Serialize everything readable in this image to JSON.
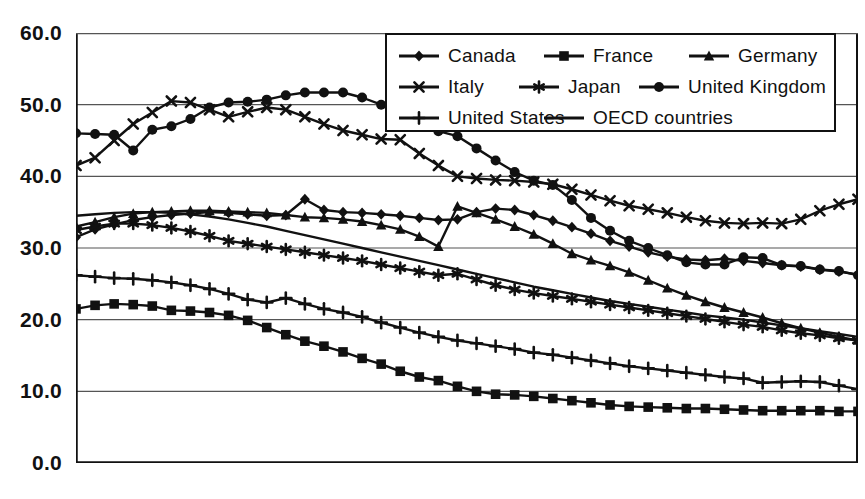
{
  "chart_data": {
    "type": "line",
    "title": "",
    "subtitle": "",
    "xlabel": "",
    "ylabel": "",
    "ylim": [
      0.0,
      60.0
    ],
    "yticks": [
      "0.0",
      "10.0",
      "20.0",
      "30.0",
      "40.0",
      "50.0",
      "60.0"
    ],
    "ytick_values": [
      0.0,
      10.0,
      20.0,
      30.0,
      40.0,
      50.0,
      60.0
    ],
    "grid": true,
    "grid_axis": "y",
    "legend_position": "top-right",
    "xtick_count": 42,
    "xtick_labels": [],
    "x": [
      1,
      2,
      3,
      4,
      5,
      6,
      7,
      8,
      9,
      10,
      11,
      12,
      13,
      14,
      15,
      16,
      17,
      18,
      19,
      20,
      21,
      22,
      23,
      24,
      25,
      26,
      27,
      28,
      29,
      30,
      31,
      32,
      33,
      34,
      35,
      36,
      37,
      38,
      39,
      40,
      41,
      42
    ],
    "series": [
      {
        "name": "Canada",
        "marker": "diamond",
        "values": [
          31.5,
          32.6,
          33.3,
          33.9,
          34.3,
          34.6,
          34.8,
          35.0,
          34.9,
          34.7,
          34.5,
          34.6,
          36.8,
          35.3,
          35.0,
          34.9,
          34.7,
          34.5,
          34.2,
          33.9,
          34.0,
          35.0,
          35.5,
          35.3,
          34.6,
          33.8,
          32.9,
          32.0,
          31.0,
          30.2,
          29.4,
          28.8,
          28.4,
          28.3,
          28.5,
          28.2,
          27.9,
          27.6,
          27.4,
          27.0,
          26.7,
          26.3
        ]
      },
      {
        "name": "France",
        "marker": "square",
        "values": [
          21.5,
          22.0,
          22.2,
          22.1,
          21.9,
          21.3,
          21.2,
          21.0,
          20.6,
          19.9,
          18.9,
          17.9,
          17.0,
          16.3,
          15.5,
          14.6,
          13.8,
          12.8,
          12.0,
          11.5,
          10.7,
          10.0,
          9.6,
          9.5,
          9.3,
          9.0,
          8.7,
          8.4,
          8.1,
          7.9,
          7.8,
          7.7,
          7.6,
          7.6,
          7.5,
          7.4,
          7.3,
          7.3,
          7.3,
          7.3,
          7.2,
          7.2
        ]
      },
      {
        "name": "Germany",
        "marker": "triangle",
        "values": [
          33.0,
          33.6,
          34.3,
          34.8,
          35.0,
          35.1,
          35.2,
          35.2,
          35.1,
          35.0,
          34.9,
          34.6,
          34.3,
          34.2,
          34.0,
          33.7,
          33.2,
          32.6,
          31.6,
          30.2,
          35.8,
          34.9,
          34.0,
          33.0,
          31.9,
          30.6,
          29.2,
          28.3,
          27.5,
          26.6,
          25.5,
          24.4,
          23.4,
          22.5,
          21.7,
          21.0,
          20.3,
          19.5,
          18.8,
          18.2,
          17.6,
          17.1
        ]
      },
      {
        "name": "Italy",
        "marker": "x",
        "values": [
          41.5,
          42.6,
          45.0,
          47.3,
          48.9,
          50.5,
          50.3,
          49.3,
          48.3,
          49.0,
          49.6,
          49.3,
          48.3,
          47.3,
          46.4,
          45.8,
          45.2,
          45.1,
          43.2,
          41.5,
          40.0,
          39.7,
          39.5,
          39.4,
          39.2,
          38.9,
          38.2,
          37.4,
          36.6,
          35.9,
          35.4,
          34.9,
          34.3,
          33.8,
          33.5,
          33.4,
          33.5,
          33.4,
          34.0,
          35.2,
          36.1,
          36.8
        ]
      },
      {
        "name": "Japan",
        "marker": "asterisk",
        "values": [
          32.5,
          33.0,
          33.4,
          33.4,
          33.2,
          32.8,
          32.3,
          31.7,
          31.0,
          30.6,
          30.2,
          29.8,
          29.4,
          29.0,
          28.6,
          28.2,
          27.7,
          27.2,
          26.7,
          26.2,
          26.4,
          25.6,
          24.8,
          24.2,
          23.7,
          23.3,
          22.9,
          22.5,
          22.1,
          21.7,
          21.3,
          20.9,
          20.5,
          20.1,
          19.7,
          19.3,
          19.0,
          18.5,
          18.1,
          17.8,
          17.4,
          17.1
        ]
      },
      {
        "name": "United Kingdom",
        "marker": "circle",
        "values": [
          46.0,
          45.9,
          45.8,
          43.6,
          46.5,
          47.0,
          48.0,
          49.6,
          50.3,
          50.4,
          50.7,
          51.3,
          51.7,
          51.7,
          51.7,
          51.0,
          50.0,
          48.8,
          48.3,
          46.3,
          45.6,
          43.9,
          42.2,
          40.6,
          39.4,
          38.8,
          36.7,
          34.2,
          32.4,
          31.0,
          30.0,
          29.0,
          28.0,
          27.7,
          27.7,
          28.7,
          28.6,
          27.6,
          27.5,
          27.0,
          26.8,
          26.2
        ]
      },
      {
        "name": "United States",
        "marker": "plus",
        "values": [
          26.2,
          26.0,
          25.8,
          25.7,
          25.5,
          25.2,
          24.8,
          24.3,
          23.6,
          22.8,
          22.4,
          23.0,
          22.2,
          21.5,
          21.0,
          20.4,
          19.6,
          18.9,
          18.2,
          17.6,
          17.1,
          16.7,
          16.3,
          15.9,
          15.4,
          15.1,
          14.7,
          14.3,
          13.9,
          13.5,
          13.2,
          12.9,
          12.6,
          12.3,
          12.0,
          11.8,
          11.2,
          11.3,
          11.4,
          11.3,
          10.8,
          10.3
        ]
      },
      {
        "name": "OECD countries",
        "marker": "none",
        "values": [
          34.5,
          34.7,
          34.9,
          35.0,
          35.0,
          34.9,
          34.7,
          34.4,
          34.0,
          33.5,
          33.0,
          32.4,
          31.8,
          31.2,
          30.6,
          30.0,
          29.4,
          28.8,
          28.2,
          27.6,
          27.0,
          26.4,
          25.8,
          25.2,
          24.6,
          24.1,
          23.6,
          23.1,
          22.6,
          22.2,
          21.8,
          21.4,
          21.0,
          20.6,
          20.3,
          20.0,
          19.6,
          19.2,
          18.8,
          18.4,
          18.0,
          17.6
        ]
      }
    ]
  },
  "axis": {
    "ylabels": [
      "60.0",
      "50.0",
      "40.0",
      "30.0",
      "20.0",
      "10.0",
      "0.0"
    ]
  },
  "legend": {
    "rows": [
      [
        {
          "label": "Canada",
          "marker": "diamond"
        },
        {
          "label": "France",
          "marker": "square"
        },
        {
          "label": "Germany",
          "marker": "triangle"
        }
      ],
      [
        {
          "label": "Italy",
          "marker": "x"
        },
        {
          "label": "Japan",
          "marker": "asterisk"
        },
        {
          "label": "United Kingdom",
          "marker": "circle"
        }
      ],
      [
        {
          "label": "United States",
          "marker": "plus"
        },
        {
          "label": "OECD countries",
          "marker": "none"
        }
      ]
    ]
  },
  "colors": {
    "ink": "#111111",
    "grid": "#555555",
    "background": "#ffffff"
  }
}
